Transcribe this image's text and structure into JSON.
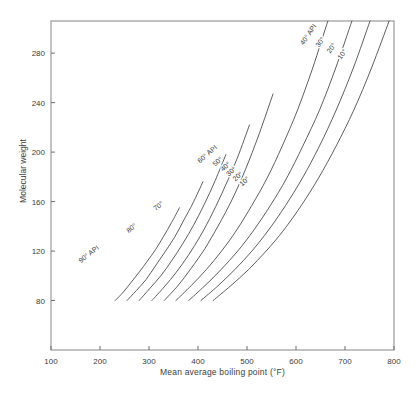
{
  "page": {
    "background": "#ffffff"
  },
  "chart_data": {
    "type": "line",
    "title": "",
    "xlabel": "Mean average boiling point (°F)",
    "ylabel": "Molecular weight",
    "xlim": [
      100,
      800
    ],
    "ylim": [
      40,
      306
    ],
    "x_ticks": [
      100,
      200,
      300,
      400,
      500,
      600,
      700,
      800
    ],
    "y_ticks": [
      80,
      120,
      160,
      200,
      240,
      280
    ],
    "grid": false,
    "legend_position": "none (curves labeled inline)",
    "line_color": "#4d4d4d",
    "frame_color": "#9a9a9a",
    "tick_color": "#6e6e6e",
    "text_color": "#3d3d3d",
    "series": [
      {
        "name": "90° API",
        "x": [
          231,
          248,
          264,
          280,
          297,
          313,
          330,
          346,
          362
        ],
        "y": [
          80,
          87,
          95,
          103,
          112,
          121,
          132,
          143,
          155
        ]
      },
      {
        "name": "80° API",
        "x": [
          255,
          274,
          294,
          313,
          332,
          352,
          371,
          390,
          410
        ],
        "y": [
          80,
          88,
          97,
          108,
          119,
          131,
          145,
          159,
          176
        ]
      },
      {
        "name": "70° API",
        "x": [
          280,
          302,
          324,
          346,
          369,
          391,
          413,
          435,
          457
        ],
        "y": [
          80,
          90,
          100,
          112,
          126,
          141,
          158,
          177,
          198
        ]
      },
      {
        "name": "60° API",
        "x": [
          306,
          331,
          356,
          381,
          406,
          430,
          455,
          480,
          505
        ],
        "y": [
          80,
          91,
          103,
          117,
          133,
          151,
          172,
          195,
          222
        ]
      },
      {
        "name": "50° API",
        "x": [
          331,
          359,
          386,
          414,
          442,
          470,
          497,
          525,
          553
        ],
        "y": [
          80,
          92,
          106,
          122,
          141,
          162,
          186,
          215,
          247
        ]
      },
      {
        "name": "40° API",
        "x": [
          355,
          386,
          417,
          448,
          479,
          510,
          541,
          572,
          603,
          634,
          665
        ],
        "y": [
          80,
          92,
          105,
          120,
          137,
          157,
          179,
          205,
          234,
          268,
          306
        ]
      },
      {
        "name": "30° API",
        "x": [
          381,
          414,
          447,
          481,
          514,
          548,
          581,
          614,
          648,
          681,
          714
        ],
        "y": [
          80,
          92,
          105,
          120,
          137,
          157,
          179,
          205,
          234,
          268,
          306
        ]
      },
      {
        "name": "20° API",
        "x": [
          406,
          441,
          475,
          510,
          544,
          579,
          613,
          648,
          682,
          717,
          751
        ],
        "y": [
          80,
          92,
          105,
          120,
          137,
          157,
          179,
          205,
          234,
          268,
          306
        ]
      },
      {
        "name": "10° API",
        "x": [
          431,
          467,
          503,
          539,
          575,
          611,
          646,
          682,
          718,
          754,
          790
        ],
        "y": [
          80,
          92,
          105,
          120,
          137,
          157,
          179,
          205,
          234,
          268,
          306
        ]
      }
    ],
    "curve_labels": [
      {
        "text": "90° API",
        "x": 180,
        "y": 116,
        "rotation": -38
      },
      {
        "text": "80°",
        "x": 267,
        "y": 137,
        "rotation": -38
      },
      {
        "text": "70°",
        "x": 322,
        "y": 155,
        "rotation": -38
      },
      {
        "text": "60° API",
        "x": 422,
        "y": 197,
        "rotation": -41
      },
      {
        "text": "50°",
        "x": 443,
        "y": 191,
        "rotation": -42
      },
      {
        "text": "40°",
        "x": 459,
        "y": 187,
        "rotation": -42
      },
      {
        "text": "30°",
        "x": 471,
        "y": 183,
        "rotation": -42
      },
      {
        "text": "20°",
        "x": 484,
        "y": 179,
        "rotation": -42
      },
      {
        "text": "10°",
        "x": 498,
        "y": 175,
        "rotation": -42
      },
      {
        "text": "40° API",
        "x": 629,
        "y": 294,
        "rotation": -55
      },
      {
        "text": "30°",
        "x": 653,
        "y": 288,
        "rotation": -55
      },
      {
        "text": "20°",
        "x": 676,
        "y": 283,
        "rotation": -55
      },
      {
        "text": "10°",
        "x": 698,
        "y": 278,
        "rotation": -55
      }
    ]
  }
}
